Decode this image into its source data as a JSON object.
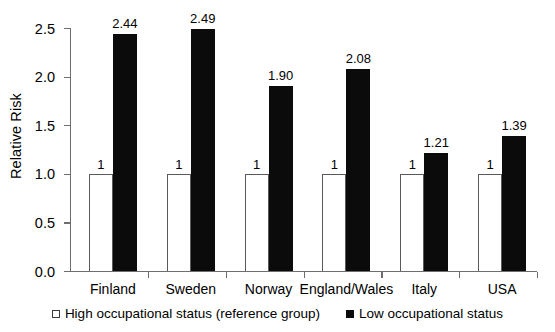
{
  "chart_data": {
    "type": "bar",
    "title": "",
    "xlabel": "",
    "ylabel": "Relative Risk",
    "ylim": [
      0.0,
      2.5
    ],
    "grid": false,
    "legend_position": "bottom-center",
    "categories": [
      "Finland",
      "Sweden",
      "Norway",
      "England/Wales",
      "Italy",
      "USA"
    ],
    "ytick_labels": [
      "0.0",
      "0.5",
      "1.0",
      "1.5",
      "2.0",
      "2.5"
    ],
    "ytick_values": [
      0.0,
      0.5,
      1.0,
      1.5,
      2.0,
      2.5
    ],
    "series": [
      {
        "name": "High occupational status (reference group)",
        "color": "#ffffff",
        "values": [
          1,
          1,
          1,
          1,
          1,
          1
        ],
        "data_labels": [
          "1",
          "1",
          "1",
          "1",
          "1",
          "1"
        ]
      },
      {
        "name": "Low occupational status",
        "color": "#0b0b0b",
        "values": [
          2.44,
          2.49,
          1.9,
          2.08,
          1.21,
          1.39
        ],
        "data_labels": [
          "2.44",
          "2.49",
          "1.90",
          "2.08",
          "1.21",
          "1.39"
        ]
      }
    ]
  },
  "legend": {
    "items": [
      {
        "label": "High occupational status (reference group)",
        "swatch": "open-square-marker"
      },
      {
        "label": "Low occupational status",
        "swatch": "filled-square-marker"
      }
    ]
  }
}
